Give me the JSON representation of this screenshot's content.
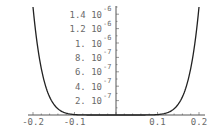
{
  "chart_data": {
    "type": "line",
    "title": "",
    "xlabel": "",
    "ylabel": "",
    "xlim": [
      -0.2,
      0.2
    ],
    "ylim": [
      0,
      1.5e-06
    ],
    "grid": false,
    "legend": null,
    "function_description": "symmetric even-power curve, flat near 0, rising steeply to ~1.5e-6 at x = ±0.2",
    "x": [
      -0.2,
      -0.18,
      -0.16,
      -0.14,
      -0.12,
      -0.1,
      -0.08,
      -0.06,
      -0.04,
      -0.02,
      0,
      0.02,
      0.04,
      0.06,
      0.08,
      0.1,
      0.12,
      0.14,
      0.16,
      0.18,
      0.2
    ],
    "series": [
      {
        "name": "f(x)",
        "color": "#222222",
        "values": [
          1.5e-06,
          6.46e-07,
          2.52e-07,
          8.65e-08,
          2.52e-08,
          5.86e-09,
          9.8e-10,
          9.8e-11,
          3.8e-12,
          1.5e-14,
          0,
          1.5e-14,
          3.8e-12,
          9.8e-11,
          9.8e-10,
          5.86e-09,
          2.52e-08,
          8.65e-08,
          2.52e-07,
          6.46e-07,
          1.5e-06
        ]
      }
    ],
    "x_ticks": [
      {
        "value": -0.2,
        "label": "-0.2"
      },
      {
        "value": -0.1,
        "label": "-0.1"
      },
      {
        "value": 0.1,
        "label": "0.1"
      },
      {
        "value": 0.2,
        "label": "0.2"
      }
    ],
    "y_ticks": [
      {
        "value": 2e-07,
        "mantissa": "2.",
        "base": "10",
        "exponent": "-7"
      },
      {
        "value": 4e-07,
        "mantissa": "4.",
        "base": "10",
        "exponent": "-7"
      },
      {
        "value": 6e-07,
        "mantissa": "6.",
        "base": "10",
        "exponent": "-7"
      },
      {
        "value": 8e-07,
        "mantissa": "8.",
        "base": "10",
        "exponent": "-7"
      },
      {
        "value": 1e-06,
        "mantissa": "1.",
        "base": "10",
        "exponent": "-6"
      },
      {
        "value": 1.2e-06,
        "mantissa": "1.2",
        "base": "10",
        "exponent": "-6"
      },
      {
        "value": 1.4e-06,
        "mantissa": "1.4",
        "base": "10",
        "exponent": "-6"
      }
    ]
  },
  "colors": {
    "axis": "#555555",
    "curve": "#222222",
    "label": "#6a6a6a",
    "background": "#ffffff"
  }
}
